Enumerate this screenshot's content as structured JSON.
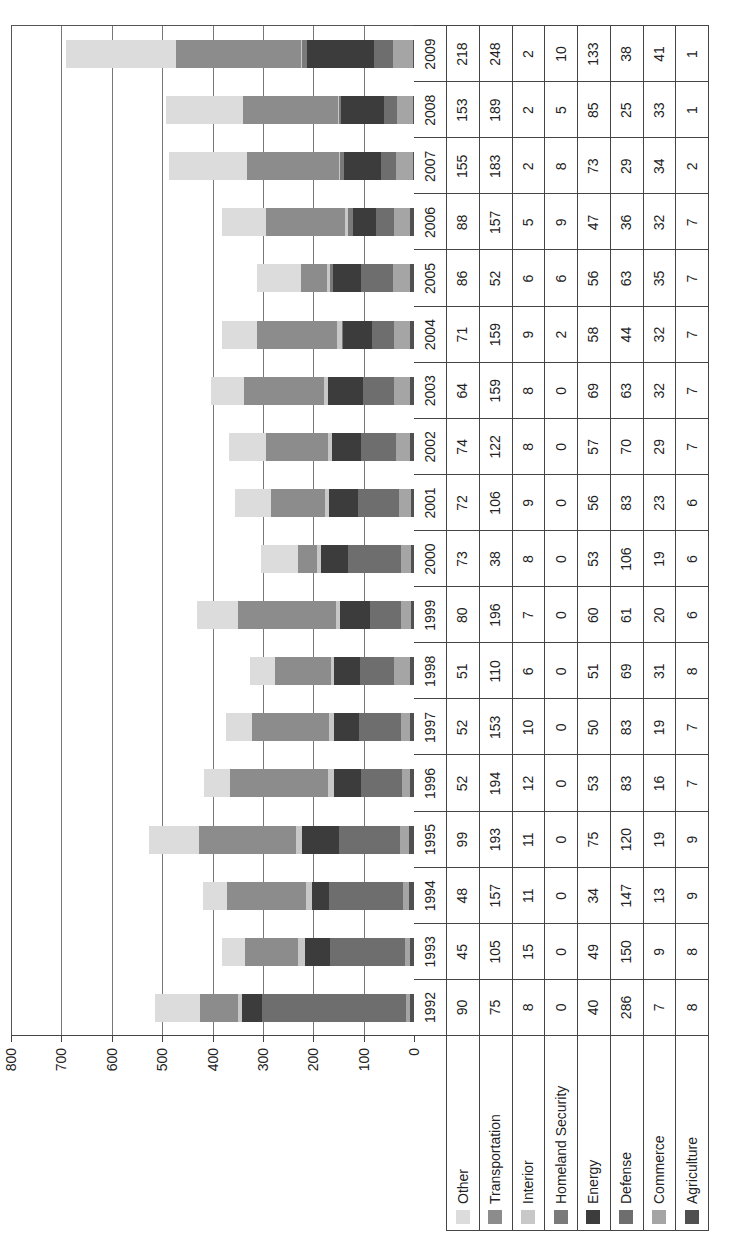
{
  "chart_data": {
    "type": "bar",
    "stacked": true,
    "title": "",
    "xlabel": "",
    "ylabel": "",
    "ylim": [
      0,
      800
    ],
    "yticks": [
      0,
      100,
      200,
      300,
      400,
      500,
      600,
      700,
      800
    ],
    "grid": true,
    "legend_position": "data-table-left",
    "orientation_note": "figure rendered rotated 90 degrees",
    "categories": [
      "1992",
      "1993",
      "1994",
      "1995",
      "1996",
      "1997",
      "1998",
      "1999",
      "2000",
      "2001",
      "2002",
      "2003",
      "2004",
      "2005",
      "2006",
      "2007",
      "2008",
      "2009"
    ],
    "series": [
      {
        "name": "Agriculture",
        "color": "#505050",
        "values": [
          8,
          8,
          9,
          9,
          7,
          7,
          8,
          6,
          6,
          6,
          7,
          7,
          7,
          7,
          7,
          2,
          1,
          1
        ]
      },
      {
        "name": "Commerce",
        "color": "#a5a5a5",
        "values": [
          7,
          9,
          13,
          19,
          16,
          19,
          31,
          20,
          19,
          23,
          29,
          32,
          32,
          35,
          32,
          34,
          33,
          41
        ]
      },
      {
        "name": "Defense",
        "color": "#6e6e6e",
        "values": [
          286,
          150,
          147,
          120,
          83,
          83,
          69,
          61,
          106,
          83,
          70,
          63,
          44,
          63,
          36,
          29,
          25,
          38
        ]
      },
      {
        "name": "Energy",
        "color": "#3c3c3c",
        "values": [
          40,
          49,
          34,
          75,
          53,
          50,
          51,
          60,
          53,
          56,
          57,
          69,
          58,
          56,
          47,
          73,
          85,
          133
        ]
      },
      {
        "name": "Homeland Security",
        "color": "#7a7a7a",
        "values": [
          0,
          0,
          0,
          0,
          0,
          0,
          0,
          0,
          0,
          0,
          0,
          0,
          2,
          6,
          9,
          8,
          5,
          10
        ]
      },
      {
        "name": "Interior",
        "color": "#c8c8c8",
        "values": [
          8,
          15,
          11,
          11,
          12,
          10,
          6,
          7,
          8,
          9,
          8,
          8,
          9,
          6,
          5,
          2,
          2,
          2
        ]
      },
      {
        "name": "Transportation",
        "color": "#8c8c8c",
        "values": [
          75,
          105,
          157,
          193,
          194,
          153,
          110,
          196,
          38,
          106,
          122,
          159,
          159,
          52,
          157,
          183,
          189,
          248
        ]
      },
      {
        "name": "Other",
        "color": "#dcdcdc",
        "values": [
          90,
          45,
          48,
          99,
          52,
          52,
          51,
          80,
          73,
          72,
          74,
          64,
          71,
          86,
          88,
          155,
          153,
          218
        ]
      }
    ]
  },
  "table": {
    "legend_order": [
      "Other",
      "Transportation",
      "Interior",
      "Homeland Security",
      "Energy",
      "Defense",
      "Commerce",
      "Agriculture"
    ]
  }
}
